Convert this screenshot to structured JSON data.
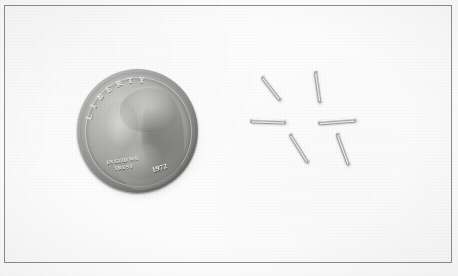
{
  "image": {
    "kind": "photograph",
    "caption": "US dime coin shown beside six small metal cylindrical pins for size comparison",
    "background_color": "#fcfcfc",
    "frame_color": "#8e8e90",
    "width": 458,
    "height": 276
  },
  "coin": {
    "name": "us-dime-obverse",
    "denomination": "dime",
    "material_color": "#a6a6a3",
    "diameter_px": 121,
    "inscriptions": {
      "liberty": "LIBERTY",
      "motto": "IN GOD WE TRUST",
      "date": "1972"
    },
    "portrait": "roosevelt-bust-facing-left"
  },
  "pins": {
    "name": "metal-pins-group",
    "count": 6,
    "color": "#cfcfcd",
    "items": [
      {
        "id": "pin-1",
        "left": 257,
        "top": 86,
        "length": 30,
        "thickness": 4,
        "angle": 52
      },
      {
        "id": "pin-2",
        "left": 303,
        "top": 85,
        "length": 32,
        "thickness": 4,
        "angle": 82
      },
      {
        "id": "pin-3",
        "left": 250,
        "top": 119,
        "length": 36,
        "thickness": 4,
        "angle": 2
      },
      {
        "id": "pin-4",
        "left": 318,
        "top": 119,
        "length": 38,
        "thickness": 4,
        "angle": -4
      },
      {
        "id": "pin-5",
        "left": 283,
        "top": 146,
        "length": 34,
        "thickness": 4,
        "angle": 58
      },
      {
        "id": "pin-6",
        "left": 327,
        "top": 147,
        "length": 34,
        "thickness": 4,
        "angle": 70
      }
    ]
  }
}
